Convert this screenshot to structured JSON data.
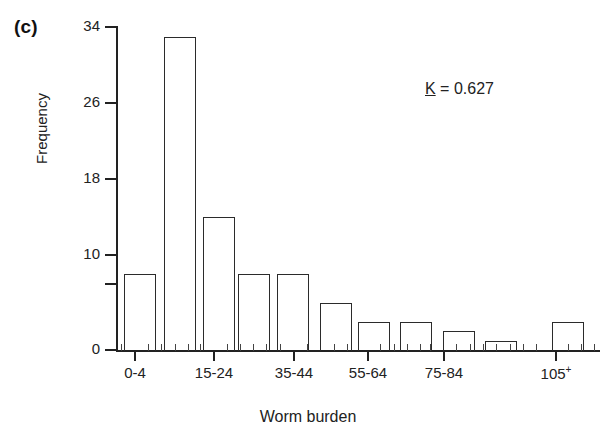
{
  "panel": {
    "letter": "(c)"
  },
  "annotation": {
    "symbol": "K",
    "rest": " = 0.627",
    "full": "K = 0.627"
  },
  "chart_data": {
    "type": "bar",
    "title": "",
    "xlabel": "Worm burden",
    "ylabel": "Frequency",
    "ylim": [
      0,
      34
    ],
    "yticks": [
      0,
      10,
      18,
      26,
      34
    ],
    "ytick_labels": [
      "0",
      "10",
      "18",
      "26",
      "34"
    ],
    "grid": false,
    "legend": null,
    "categories": [
      "0-4",
      "5-14",
      "15-24",
      "25-34",
      "35-44",
      "45-54",
      "55-64",
      "65-74",
      "75-84",
      "85-94",
      "105+"
    ],
    "xtick_labels": [
      "0-4",
      "15-24",
      "35-44",
      "55-64",
      "75-84",
      "105+"
    ],
    "values": [
      8,
      33,
      14,
      8,
      8,
      5,
      3,
      3,
      2,
      1,
      3
    ],
    "annotation_text": "K = 0.627"
  },
  "bars": [
    {
      "label": "0-4",
      "value": 8,
      "x": 124,
      "w": 32
    },
    {
      "label": "5-14",
      "value": 33,
      "x": 164,
      "w": 32
    },
    {
      "label": "15-24",
      "value": 14,
      "x": 203,
      "w": 32
    },
    {
      "label": "25-34",
      "value": 8,
      "x": 238,
      "w": 32
    },
    {
      "label": "35-44",
      "value": 8,
      "x": 277,
      "w": 32
    },
    {
      "label": "45-54",
      "value": 5,
      "x": 320,
      "w": 32
    },
    {
      "label": "55-64",
      "value": 3,
      "x": 358,
      "w": 32
    },
    {
      "label": "65-74",
      "value": 3,
      "x": 400,
      "w": 32
    },
    {
      "label": "75-84",
      "value": 2,
      "x": 443,
      "w": 32
    },
    {
      "label": "85-94",
      "value": 1,
      "x": 485,
      "w": 32
    },
    {
      "label": "105+",
      "value": 3,
      "x": 552,
      "w": 32
    }
  ],
  "yticks": [
    {
      "label": "34",
      "value": 34
    },
    {
      "label": "26",
      "value": 26
    },
    {
      "label": "18",
      "value": 18
    },
    {
      "label": "10",
      "value": 10
    },
    {
      "label": "",
      "value": 7
    },
    {
      "label": "0",
      "value": 0
    }
  ],
  "xticks_major": [
    {
      "label": "0-4",
      "x": 134
    },
    {
      "label": "15-24",
      "x": 213
    },
    {
      "label": "35-44",
      "x": 293
    },
    {
      "label": "55-64",
      "x": 367
    },
    {
      "label": "75-84",
      "x": 443
    },
    {
      "label": "105+",
      "x": 555
    }
  ],
  "xticks_minor_x": [
    121,
    148,
    161,
    175,
    188,
    200,
    227,
    240,
    253,
    266,
    280,
    307,
    320,
    334,
    347,
    380,
    394,
    407,
    420,
    430,
    456,
    470,
    483,
    496,
    510,
    523,
    536,
    568,
    581,
    594
  ],
  "colors": {
    "axis": "#222222",
    "bar_stroke": "#2b2b2b",
    "bar_fill": "transparent",
    "text": "#1a1a1a",
    "background": "#ffffff"
  }
}
